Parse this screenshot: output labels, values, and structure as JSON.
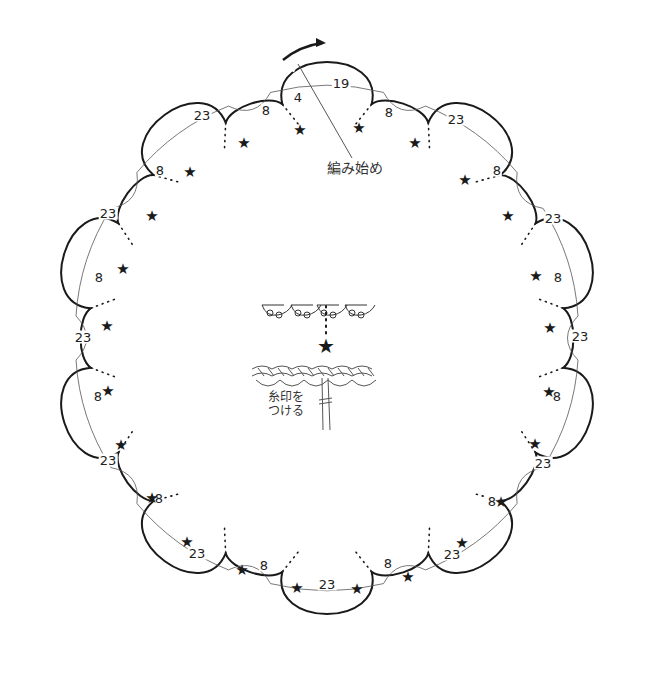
{
  "diagram": {
    "type": "crochet-edging-chart",
    "center": [
      327,
      338
    ],
    "big_scallop_count": 10,
    "big_scallop_radius_outer": 290,
    "small_scallop_radius_outer": 252,
    "stroke_color": "#1a1a1a",
    "thin_line_color": "#555555",
    "start_label": "編み始め",
    "start_arrow": "clockwise-arrow",
    "inset_label_line1": "糸印を",
    "inset_label_line2": "つける",
    "star_symbol": "★"
  },
  "labels": [
    {
      "text": "19",
      "x": 341,
      "y": 83
    },
    {
      "text": "4",
      "x": 298,
      "y": 97
    },
    {
      "text": "8",
      "x": 266,
      "y": 110
    },
    {
      "text": "23",
      "x": 202,
      "y": 115
    },
    {
      "text": "8",
      "x": 160,
      "y": 170
    },
    {
      "text": "23",
      "x": 108,
      "y": 213
    },
    {
      "text": "8",
      "x": 99,
      "y": 277
    },
    {
      "text": "23",
      "x": 83,
      "y": 337
    },
    {
      "text": "8",
      "x": 98,
      "y": 396
    },
    {
      "text": "23",
      "x": 108,
      "y": 460
    },
    {
      "text": "8",
      "x": 159,
      "y": 498
    },
    {
      "text": "23",
      "x": 197,
      "y": 553
    },
    {
      "text": "8",
      "x": 264,
      "y": 565
    },
    {
      "text": "23",
      "x": 327,
      "y": 584
    },
    {
      "text": "8",
      "x": 388,
      "y": 563
    },
    {
      "text": "23",
      "x": 452,
      "y": 554
    },
    {
      "text": "8",
      "x": 492,
      "y": 501
    },
    {
      "text": "23",
      "x": 543,
      "y": 463
    },
    {
      "text": "8",
      "x": 557,
      "y": 396
    },
    {
      "text": "23",
      "x": 580,
      "y": 336
    },
    {
      "text": "8",
      "x": 558,
      "y": 277
    },
    {
      "text": "23",
      "x": 553,
      "y": 218
    },
    {
      "text": "8",
      "x": 497,
      "y": 170
    },
    {
      "text": "23",
      "x": 456,
      "y": 119
    },
    {
      "text": "8",
      "x": 389,
      "y": 112
    }
  ],
  "stars": [
    {
      "x": 244,
      "y": 143
    },
    {
      "x": 300,
      "y": 130
    },
    {
      "x": 359,
      "y": 128
    },
    {
      "x": 415,
      "y": 143
    },
    {
      "x": 465,
      "y": 180
    },
    {
      "x": 508,
      "y": 216
    },
    {
      "x": 536,
      "y": 276
    },
    {
      "x": 550,
      "y": 328
    },
    {
      "x": 549,
      "y": 392
    },
    {
      "x": 535,
      "y": 444
    },
    {
      "x": 501,
      "y": 502
    },
    {
      "x": 462,
      "y": 543
    },
    {
      "x": 408,
      "y": 577
    },
    {
      "x": 357,
      "y": 589
    },
    {
      "x": 297,
      "y": 588
    },
    {
      "x": 242,
      "y": 570
    },
    {
      "x": 187,
      "y": 542
    },
    {
      "x": 152,
      "y": 498
    },
    {
      "x": 121,
      "y": 445
    },
    {
      "x": 108,
      "y": 391
    },
    {
      "x": 107,
      "y": 326
    },
    {
      "x": 123,
      "y": 269
    },
    {
      "x": 152,
      "y": 216
    },
    {
      "x": 190,
      "y": 172
    }
  ],
  "inset": {
    "star": {
      "x": 326,
      "y": 346
    },
    "label_x": 270,
    "label_y": 398
  }
}
